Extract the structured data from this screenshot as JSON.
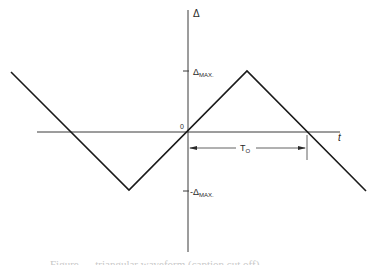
{
  "diagram": {
    "type": "triangular-waveform",
    "axes": {
      "y_label": "Δ",
      "x_label": "t",
      "origin_label": "0"
    },
    "ticks": {
      "positive": {
        "prefix": "Δ",
        "subscript": "MAX."
      },
      "negative": {
        "prefix": "-Δ",
        "subscript": "MAX."
      }
    },
    "dimension": {
      "label_main": "T",
      "label_sub": "O"
    },
    "waveform_points": [
      [
        11,
        72
      ],
      [
        129,
        190
      ],
      [
        247,
        71
      ],
      [
        366,
        191
      ]
    ],
    "colors": {
      "line": "#1a1a1a",
      "axis": "#3a3a3a",
      "background": "#ffffff"
    }
  },
  "caption": {
    "text": "Figure — triangular waveform (caption cut off)"
  }
}
